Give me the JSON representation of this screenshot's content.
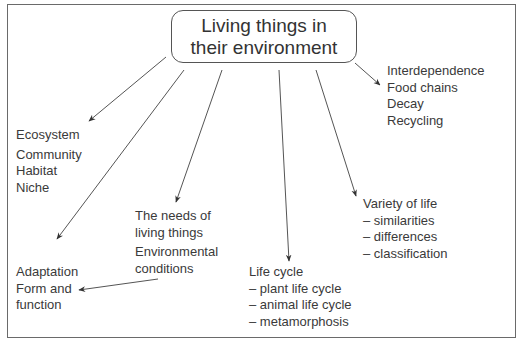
{
  "diagram": {
    "title_line1": "Living things in",
    "title_line2": "their environment",
    "nodes": {
      "interdependence": {
        "lines": [
          "Interdependence",
          "Food chains",
          "Decay",
          "Recycling"
        ]
      },
      "ecosystem": {
        "lines": [
          "Ecosystem",
          "Community",
          "Habitat",
          "Niche"
        ]
      },
      "needs": {
        "lines": [
          "The needs of",
          "living things",
          "Environmental",
          "conditions"
        ]
      },
      "variety": {
        "lines": [
          "Variety of life",
          "– similarities",
          "– differences",
          "– classification"
        ]
      },
      "adaptation": {
        "lines": [
          "Adaptation",
          "Form and",
          "function"
        ]
      },
      "life_cycle": {
        "lines": [
          "Life cycle",
          "– plant life cycle",
          "– animal life cycle",
          "– metamorphosis"
        ]
      }
    },
    "colors": {
      "line": "#555555",
      "text": "#3a3a3a",
      "frame": "#6a6a6a"
    }
  }
}
